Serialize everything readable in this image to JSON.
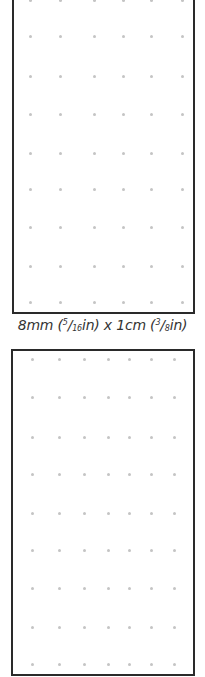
{
  "panels": [
    {
      "name": "dot-grid-8mm-x-1cm",
      "columns_x": [
        30,
        60,
        94,
        123,
        151,
        182
      ],
      "rows_y": [
        0,
        36,
        76,
        114,
        153,
        189,
        227,
        266,
        302
      ],
      "dot_color": "#c4c4c4"
    },
    {
      "name": "dot-grid-second",
      "columns_x": [
        32,
        59,
        84,
        108,
        129,
        151,
        174
      ],
      "rows_y": [
        359,
        397,
        437,
        474,
        513,
        550,
        588,
        627,
        664
      ],
      "dot_color": "#c4c4c4"
    }
  ],
  "caption": {
    "prefix": "8mm (",
    "frac1_num": "5",
    "frac1_den": "16",
    "mid": "in) x 1cm (",
    "frac2_num": "3",
    "frac2_den": "8",
    "suffix": "in)"
  }
}
